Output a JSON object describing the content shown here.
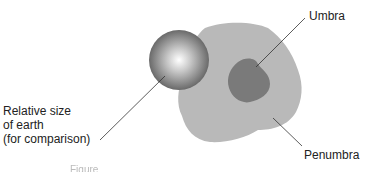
{
  "diagram": {
    "labels": {
      "umbra": "Umbra",
      "penumbra": "Penumbra",
      "earth_line1": "Relative size",
      "earth_line2": "of earth",
      "earth_line3": "(for comparison)"
    },
    "caption_partial": "Figure",
    "colors": {
      "penumbra": "#b9b9b9",
      "umbra": "#7a7a7a",
      "earth_highlight": "#ffffff",
      "earth_shadow": "#5a5a5a",
      "leader_line": "#333333"
    }
  }
}
